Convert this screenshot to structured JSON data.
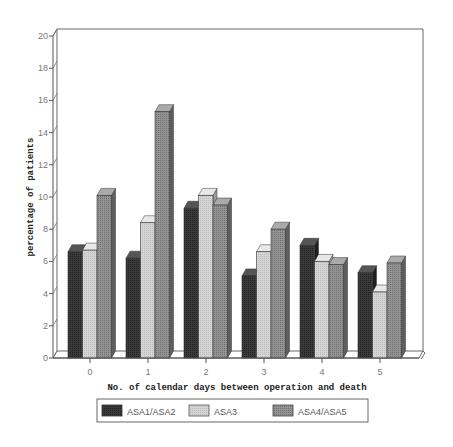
{
  "chart_data": {
    "type": "bar",
    "title": "",
    "xlabel": "No. of calendar days between operation and death",
    "ylabel": "percentage of patients",
    "categories": [
      "0",
      "1",
      "2",
      "3",
      "4",
      "5"
    ],
    "series": [
      {
        "name": "ASA1/ASA2",
        "color": "#3a3a3a",
        "values": [
          6.6,
          6.2,
          9.3,
          5.1,
          7.0,
          5.3
        ]
      },
      {
        "name": "ASA3",
        "color": "#d0d0d0",
        "values": [
          6.7,
          8.4,
          10.1,
          6.6,
          6.0,
          4.1
        ]
      },
      {
        "name": "ASA4/ASA5",
        "color": "#8c8c8c",
        "values": [
          10.1,
          15.3,
          9.5,
          8.0,
          5.8,
          5.9
        ]
      }
    ],
    "ylim": [
      0,
      20
    ],
    "yticks": [
      0,
      2,
      4,
      6,
      8,
      10,
      12,
      14,
      16,
      18,
      20
    ],
    "grid": false,
    "legend_position": "bottom",
    "style": "3d-bar"
  },
  "legend": {
    "items": [
      {
        "label": "ASA1/ASA2"
      },
      {
        "label": "ASA3"
      },
      {
        "label": "ASA4/ASA5"
      }
    ]
  }
}
